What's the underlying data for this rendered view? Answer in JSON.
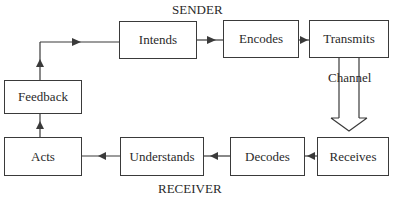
{
  "diagram": {
    "title_top": "SENDER",
    "title_bottom": "RECEIVER",
    "channel_label": "Channel",
    "boxes": {
      "intends": "Intends",
      "encodes": "Encodes",
      "transmits": "Transmits",
      "receives": "Receives",
      "decodes": "Decodes",
      "understands": "Understands",
      "acts": "Acts",
      "feedback": "Feedback"
    },
    "flow": [
      "Intends",
      "Encodes",
      "Transmits",
      "Channel",
      "Receives",
      "Decodes",
      "Understands",
      "Acts",
      "Feedback",
      "Intends"
    ],
    "colors": {
      "line": "#3a3a3a",
      "text": "#2a2a2a",
      "background": "#ffffff"
    }
  }
}
